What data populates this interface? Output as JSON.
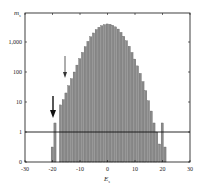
{
  "chart_data": {
    "type": "bar",
    "title": "",
    "xlabel": "E_s",
    "ylabel": "m_s",
    "xlim": [
      -30,
      30
    ],
    "x_ticks": [
      -30,
      -20,
      -10,
      0,
      10,
      20,
      30
    ],
    "y_scale": "log (offset, 0 at bottom)",
    "y_ticks": [
      0,
      1,
      10,
      100,
      1000
    ],
    "y_tick_labels": [
      "0",
      "1",
      "10",
      "100",
      "1,000"
    ],
    "reference_line_y": 1,
    "annotations": [
      {
        "type": "arrow",
        "x": -20,
        "direction": "down",
        "weight": "bold"
      },
      {
        "type": "arrow",
        "x": -15.5,
        "direction": "down",
        "weight": "thin"
      }
    ],
    "x": [
      -20,
      -19,
      -18,
      -17,
      -16,
      -15,
      -14,
      -13,
      -12,
      -11,
      -10,
      -9,
      -8,
      -7,
      -6,
      -5,
      -4,
      -3,
      -2,
      -1,
      0,
      1,
      2,
      3,
      4,
      5,
      6,
      7,
      8,
      9,
      10,
      11,
      12,
      13,
      14,
      15,
      16,
      17,
      18,
      19,
      20,
      21
    ],
    "values": [
      0.5,
      2,
      0,
      8,
      12,
      20,
      35,
      60,
      100,
      170,
      280,
      450,
      700,
      1050,
      1500,
      2000,
      2600,
      3100,
      3500,
      3800,
      4000,
      3900,
      3600,
      3200,
      2700,
      2100,
      1550,
      1100,
      720,
      450,
      270,
      160,
      90,
      48,
      24,
      11,
      5,
      2,
      1,
      0.6,
      2,
      0.5
    ]
  },
  "axes": {
    "y_label": "m",
    "y_label_sub": "s",
    "x_label": "E",
    "x_label_sub": "s"
  }
}
